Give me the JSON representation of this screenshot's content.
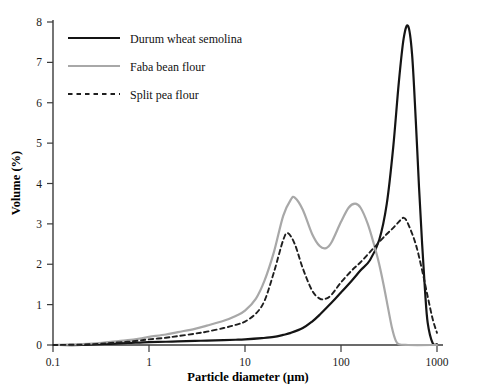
{
  "chart_data": {
    "type": "line",
    "title": "",
    "xlabel": "Particle diameter (µm)",
    "ylabel": "Volume (%)",
    "xscale": "log",
    "xlim": [
      0.1,
      1000
    ],
    "ylim": [
      0,
      8
    ],
    "xticks": [
      "0.1",
      "1",
      "10",
      "100",
      "1000"
    ],
    "xtick_values": [
      0.1,
      1,
      10,
      100,
      1000
    ],
    "yticks": [
      "0",
      "1",
      "2",
      "3",
      "4",
      "5",
      "6",
      "7",
      "8"
    ],
    "ytick_values": [
      0,
      1,
      2,
      3,
      4,
      5,
      6,
      7,
      8
    ],
    "grid": false,
    "legend_position": "upper-left",
    "legend": [
      {
        "label": "Durum wheat semolina",
        "style": "solid",
        "color": "#141414",
        "width": 2.2
      },
      {
        "label": "Faba bean flour",
        "style": "solid",
        "color": "#a8a8a8",
        "width": 2.2
      },
      {
        "label": "Split pea flour",
        "style": "dashed",
        "color": "#1f1f1f",
        "width": 1.9
      }
    ],
    "series": [
      {
        "name": "Durum wheat semolina",
        "style": "solid",
        "color": "#141414",
        "peaks": [
          {
            "x": 500,
            "y": 7.9
          }
        ],
        "x": [
          0.1,
          0.2,
          0.3,
          0.4,
          0.6,
          0.8,
          1,
          1.5,
          2,
          3,
          4,
          6,
          8,
          10,
          15,
          20,
          25,
          30,
          40,
          50,
          60,
          80,
          100,
          130,
          160,
          200,
          250,
          300,
          350,
          400,
          450,
          500,
          550,
          600,
          650,
          700,
          750,
          800,
          900,
          1000
        ],
        "y": [
          0,
          0,
          0.02,
          0.03,
          0.05,
          0.06,
          0.07,
          0.08,
          0.09,
          0.1,
          0.11,
          0.12,
          0.13,
          0.14,
          0.17,
          0.2,
          0.25,
          0.3,
          0.42,
          0.58,
          0.75,
          1.05,
          1.3,
          1.6,
          1.85,
          2.1,
          2.6,
          3.5,
          4.9,
          6.5,
          7.6,
          7.9,
          7.2,
          5.6,
          3.9,
          2.5,
          1.35,
          0.55,
          0.05,
          0.02
        ]
      },
      {
        "name": "Faba bean flour",
        "style": "solid",
        "color": "#a8a8a8",
        "peaks": [
          {
            "x": 33,
            "y": 3.65
          },
          {
            "x": 140,
            "y": 3.5
          }
        ],
        "x": [
          0.1,
          0.2,
          0.3,
          0.4,
          0.6,
          0.8,
          1,
          1.5,
          2,
          3,
          4,
          6,
          8,
          10,
          13,
          16,
          20,
          25,
          30,
          33,
          40,
          50,
          60,
          70,
          80,
          100,
          120,
          140,
          160,
          190,
          220,
          250,
          280,
          310,
          340,
          370,
          400,
          500,
          1000
        ],
        "y": [
          0,
          0.02,
          0.05,
          0.08,
          0.12,
          0.16,
          0.2,
          0.26,
          0.32,
          0.4,
          0.48,
          0.6,
          0.72,
          0.85,
          1.15,
          1.6,
          2.3,
          3.2,
          3.6,
          3.65,
          3.35,
          2.75,
          2.45,
          2.4,
          2.55,
          3.05,
          3.4,
          3.5,
          3.4,
          3.0,
          2.5,
          2.0,
          1.45,
          0.9,
          0.42,
          0.12,
          0.02,
          0,
          0
        ]
      },
      {
        "name": "Split pea flour",
        "style": "dashed",
        "color": "#1f1f1f",
        "peaks": [
          {
            "x": 28,
            "y": 2.77
          },
          {
            "x": 450,
            "y": 3.15
          }
        ],
        "x": [
          0.1,
          0.2,
          0.3,
          0.4,
          0.6,
          0.8,
          1,
          1.5,
          2,
          3,
          4,
          6,
          8,
          10,
          13,
          16,
          20,
          25,
          28,
          33,
          40,
          50,
          60,
          70,
          80,
          100,
          130,
          160,
          200,
          250,
          300,
          350,
          400,
          450,
          500,
          600,
          700,
          800,
          900,
          1000
        ],
        "y": [
          0,
          0.01,
          0.03,
          0.05,
          0.08,
          0.11,
          0.14,
          0.18,
          0.22,
          0.28,
          0.33,
          0.42,
          0.5,
          0.58,
          0.78,
          1.1,
          1.8,
          2.6,
          2.77,
          2.5,
          1.9,
          1.35,
          1.15,
          1.15,
          1.25,
          1.55,
          1.85,
          2.05,
          2.3,
          2.55,
          2.75,
          2.9,
          3.05,
          3.15,
          3.0,
          2.5,
          1.85,
          1.2,
          0.65,
          0.3
        ]
      }
    ]
  },
  "axes": {
    "x_label": "Particle diameter (µm)",
    "y_label": "Volume (%)"
  },
  "colors": {
    "durum": "#141414",
    "faba": "#a8a8a8",
    "pea": "#1f1f1f",
    "axis": "#3a3a3a"
  }
}
